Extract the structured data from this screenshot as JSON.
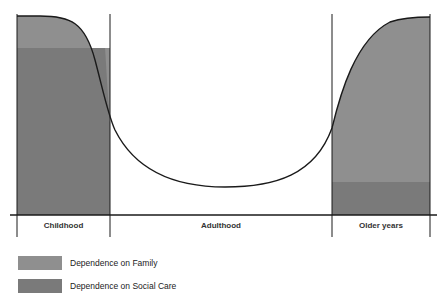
{
  "diagram": {
    "title": "",
    "type": "dependence-over-life-course",
    "stages": [
      {
        "label": "Childhood"
      },
      {
        "label": "Adulthood"
      },
      {
        "label": "Older years"
      }
    ],
    "colors": {
      "family": "#8f8f8f",
      "social_care": "#7a7a7a",
      "line": "#1a1a1a"
    }
  },
  "legend": {
    "items": [
      {
        "label": "Dependence on Family",
        "color": "#8f8f8f"
      },
      {
        "label": "Dependence on Social Care",
        "color": "#7a7a7a"
      }
    ]
  }
}
